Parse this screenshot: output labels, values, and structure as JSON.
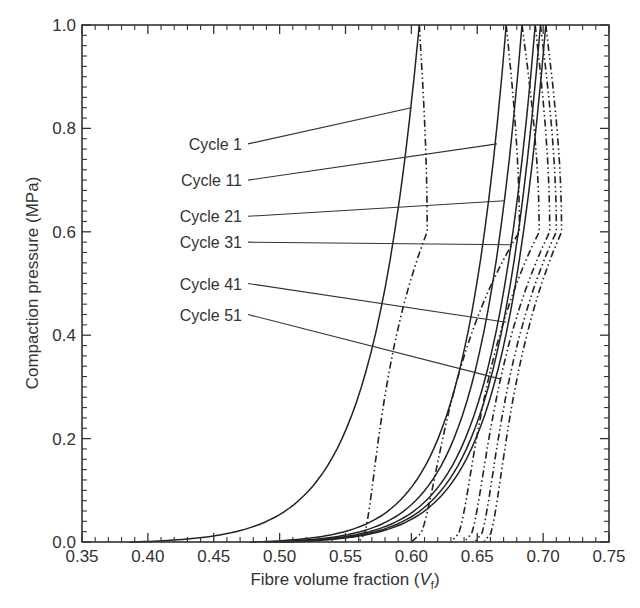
{
  "chart_data": {
    "type": "line",
    "title": "",
    "xlabel": "Fibre volume fraction (V_f)",
    "xlabel_main": "Fibre volume fraction (",
    "xlabel_var": "V",
    "xlabel_sub": "f",
    "xlabel_close": ")",
    "ylabel": "Compaction pressure (MPa)",
    "xlim": [
      0.35,
      0.75
    ],
    "ylim": [
      0.0,
      1.0
    ],
    "xticks": [
      "0.35",
      "0.40",
      "0.45",
      "0.50",
      "0.55",
      "0.60",
      "0.65",
      "0.70",
      "0.75"
    ],
    "yticks": [
      "0.0",
      "0.2",
      "0.4",
      "0.6",
      "0.8",
      "1.0"
    ],
    "grid": false,
    "legend": "callout labels with leader lines (left side)",
    "line_styles": {
      "loading": "solid",
      "unloading": "dash-dot-dot"
    },
    "series": [
      {
        "name": "Cycle 1",
        "start_vf": 0.386,
        "peak_vf": 0.606,
        "unload_end_vf": 0.56,
        "unload_mid_vf": 0.612,
        "label_y": 0.77,
        "leader_to": [
          0.6,
          0.84
        ]
      },
      {
        "name": "Cycle 11",
        "start_vf": 0.478,
        "peak_vf": 0.672,
        "unload_end_vf": 0.6,
        "unload_mid_vf": 0.682,
        "label_y": 0.7,
        "leader_to": [
          0.665,
          0.77
        ]
      },
      {
        "name": "Cycle 21",
        "start_vf": 0.49,
        "peak_vf": 0.684,
        "unload_end_vf": 0.63,
        "unload_mid_vf": 0.697,
        "label_y": 0.63,
        "leader_to": [
          0.671,
          0.66
        ]
      },
      {
        "name": "Cycle 31",
        "start_vf": 0.495,
        "peak_vf": 0.694,
        "unload_end_vf": 0.64,
        "unload_mid_vf": 0.705,
        "label_y": 0.58,
        "leader_to": [
          0.676,
          0.575
        ]
      },
      {
        "name": "Cycle 41",
        "start_vf": 0.5,
        "peak_vf": 0.698,
        "unload_end_vf": 0.648,
        "unload_mid_vf": 0.71,
        "label_y": 0.5,
        "leader_to": [
          0.672,
          0.425
        ]
      },
      {
        "name": "Cycle 51",
        "start_vf": 0.503,
        "peak_vf": 0.702,
        "unload_end_vf": 0.655,
        "unload_mid_vf": 0.714,
        "label_y": 0.44,
        "leader_to": [
          0.668,
          0.315
        ]
      }
    ]
  }
}
